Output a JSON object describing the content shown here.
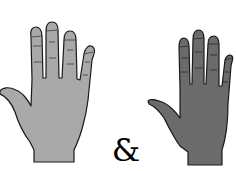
{
  "illustration": {
    "left_hand": {
      "label": "light hand",
      "fill": "#a9a9a9",
      "stroke": "#1a1a1a"
    },
    "right_hand": {
      "label": "dark hand",
      "fill": "#6b6b6b",
      "stroke": "#1a1a1a"
    },
    "connector": "&"
  }
}
